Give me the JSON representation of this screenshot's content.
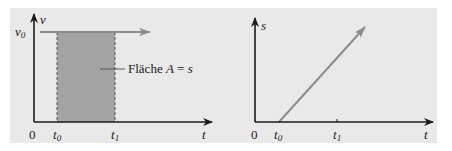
{
  "figure": {
    "left_panel": {
      "y_axis_label": "v",
      "x_axis_label": "t",
      "origin_label": "0",
      "y_tick_label": "v",
      "y_tick_sub": "0",
      "x_ticks": [
        {
          "base": "t",
          "sub": "0"
        },
        {
          "base": "t",
          "sub": "1"
        }
      ],
      "area_label_prefix": "Fläche ",
      "area_label_var": "A",
      "area_label_eq": " = ",
      "area_label_rhs": "s"
    },
    "right_panel": {
      "y_axis_label": "s",
      "x_axis_label": "t",
      "origin_label": "0",
      "x_ticks": [
        {
          "base": "t",
          "sub": "0"
        },
        {
          "base": "t",
          "sub": "1"
        }
      ]
    },
    "colors": {
      "background": "#e9e9e9",
      "shaded_area": "#a3a3a3",
      "line_gray": "#8c8c8c",
      "axis": "#1a1a1a"
    }
  }
}
